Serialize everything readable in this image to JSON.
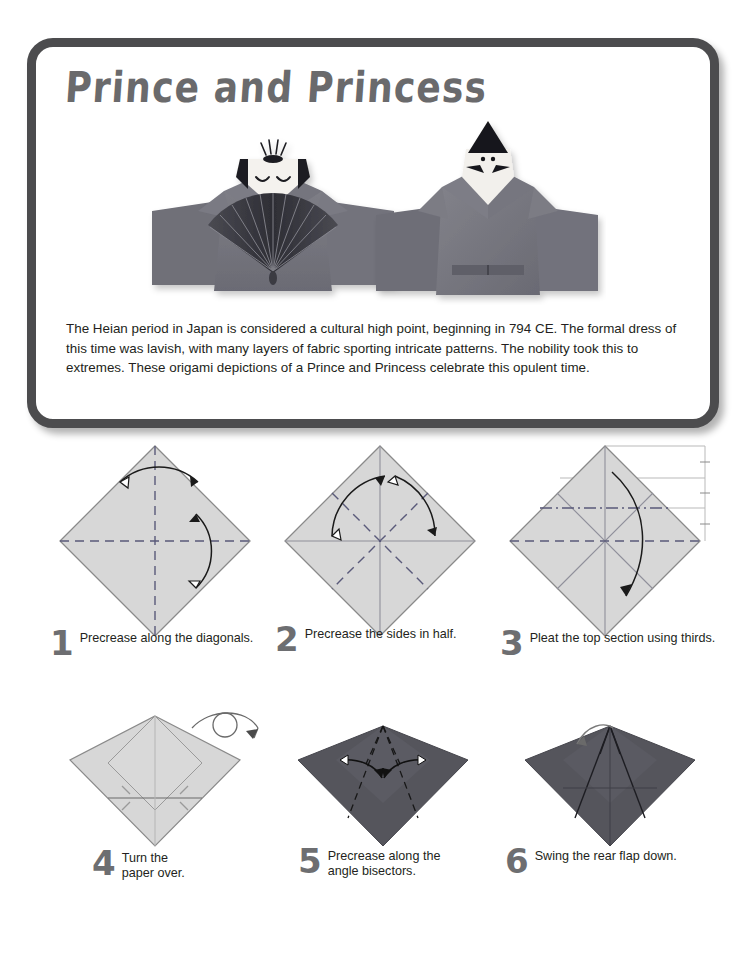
{
  "page": {
    "background": "#ffffff",
    "frame_color": "#4c4c4e",
    "paper_light": "#d7d7d7",
    "paper_dark": "#55555c",
    "title_color": "#6a6a6c",
    "text_color": "#231f20"
  },
  "card": {
    "title": "Prince and Princess",
    "body": "The Heian period in Japan is considered a cultural high point, beginning in 794 CE. The formal dress of this time was lavish, with many layers of fabric sporting intricate patterns. The nobility took this to extremes. These origami depictions of a Prince and Princess celebrate this opulent time.",
    "photo_caption": "Photograph of two folded origami figures: a Princess holding a pleated fan on the left and a Prince wearing a black hat on the right."
  },
  "steps": [
    {
      "number": "1",
      "caption": "Precrease along the diagonals.",
      "paper": "light",
      "creases": "vertical and horizontal dashed valley folds",
      "arrows": "two double-headed curved precrease arrows"
    },
    {
      "number": "2",
      "caption": "Precrease the sides in half.",
      "paper": "light",
      "creases": "two dashed diagonal folds plus solid existing axes",
      "arrows": "two curved precrease arrows to the top corner"
    },
    {
      "number": "3",
      "caption": "Pleat the top section using thirds.",
      "paper": "light",
      "creases": "dash-dot mountain line and dashed valley line",
      "arrows": "one long curved pleat arrow",
      "guides": "thirds measurement guide lines at right"
    },
    {
      "number": "4",
      "caption": "Turn the\npaper over.",
      "paper": "light with dark wings",
      "creases": "solid horizontal crease and short tick creases",
      "arrows": "turn-over loop symbol"
    },
    {
      "number": "5",
      "caption": "Precrease along the\nangle bisectors.",
      "paper": "dark",
      "creases": "dashed angle bisector folds",
      "arrows": "two inward curved precrease arrows"
    },
    {
      "number": "6",
      "caption": "Swing the rear flap down.",
      "paper": "dark",
      "creases": "solid bisector creases",
      "arrows": "small curved swing arrow"
    }
  ]
}
